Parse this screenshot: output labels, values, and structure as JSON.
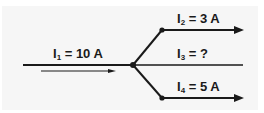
{
  "diagram": {
    "type": "current-junction",
    "colors": {
      "line": "#1a1a1a",
      "background": "#f6f6f6"
    },
    "labels": {
      "i1": {
        "symbol": "I",
        "sub": "1",
        "value": " = 10 A"
      },
      "i2": {
        "symbol": "I",
        "sub": "2",
        "value": " = 3 A"
      },
      "i3": {
        "symbol": "I",
        "sub": "3",
        "value": " = ?"
      },
      "i4": {
        "symbol": "I",
        "sub": "4",
        "value": " = 5 A"
      }
    }
  }
}
